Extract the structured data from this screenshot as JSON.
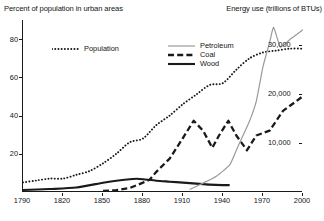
{
  "titles": {
    "left_axis": "Percent of population in urban areas",
    "right_axis": "Energy use (trillions of BTUs)"
  },
  "legend_left": [
    {
      "label": "Population",
      "style": "dotted",
      "color": "#1a1a1a"
    }
  ],
  "legend_right": [
    {
      "label": "Petroleum",
      "style": "thin-solid",
      "color": "#9a9a9a"
    },
    {
      "label": "Coal",
      "style": "bold-dashed",
      "color": "#1a1a1a"
    },
    {
      "label": "Wood",
      "style": "bold-solid",
      "color": "#1a1a1a"
    }
  ],
  "axes": {
    "x_ticks": [
      "1790",
      "1820",
      "1850",
      "1880",
      "1910",
      "1940",
      "1970",
      "2000"
    ],
    "y_left_ticks": [
      "20",
      "40",
      "60",
      "80"
    ],
    "y_right_ticks": [
      "10,000",
      "20,000",
      "30,000"
    ]
  },
  "chart_data": {
    "type": "line",
    "title": "",
    "xlabel": "",
    "ylabel": "Percent of population in urban areas",
    "y2label": "Energy use (trillions of BTUs)",
    "xlim": [
      1790,
      2000
    ],
    "ylim": [
      0,
      90
    ],
    "y2lim": [
      0,
      35000
    ],
    "grid": false,
    "legend_position": "inside-top",
    "x_ticks": [
      1790,
      1820,
      1850,
      1880,
      1910,
      1940,
      1970,
      2000
    ],
    "y_left_ticks": [
      20,
      40,
      60,
      80
    ],
    "y_right_ticks": [
      10000,
      20000,
      30000
    ],
    "series": [
      {
        "name": "Population",
        "axis": "left",
        "units": "percent",
        "style": "dotted",
        "color": "#1a1a1a",
        "x": [
          1790,
          1800,
          1810,
          1820,
          1830,
          1840,
          1850,
          1860,
          1870,
          1880,
          1890,
          1900,
          1910,
          1920,
          1930,
          1940,
          1950,
          1960,
          1970,
          1980,
          1990,
          2000
        ],
        "values": [
          5,
          6,
          7,
          7,
          9,
          11,
          15,
          20,
          26,
          28,
          35,
          40,
          46,
          51,
          56,
          57,
          64,
          70,
          73,
          74,
          75,
          75
        ]
      },
      {
        "name": "Wood",
        "axis": "right",
        "units": "trillions of BTUs",
        "style": "bold-solid",
        "color": "#1a1a1a",
        "x": [
          1790,
          1810,
          1830,
          1850,
          1860,
          1870,
          1875,
          1880,
          1890,
          1900,
          1910,
          1920,
          1930,
          1940,
          1945
        ],
        "values": [
          400,
          600,
          900,
          1900,
          2300,
          2600,
          2700,
          2600,
          2300,
          2100,
          1900,
          1700,
          1500,
          1400,
          1400
        ]
      },
      {
        "name": "Coal",
        "axis": "right",
        "units": "trillions of BTUs",
        "style": "bold-dashed",
        "color": "#1a1a1a",
        "x": [
          1850,
          1860,
          1870,
          1880,
          1885,
          1890,
          1900,
          1910,
          1918,
          1925,
          1932,
          1937,
          1944,
          1950,
          1958,
          1965,
          1975,
          1985,
          1995,
          2000
        ],
        "values": [
          200,
          400,
          800,
          1900,
          2500,
          4100,
          6800,
          11000,
          14500,
          12500,
          9000,
          11500,
          14500,
          11500,
          8500,
          11500,
          12500,
          16500,
          18500,
          19500
        ]
      },
      {
        "name": "Petroleum",
        "axis": "right",
        "units": "trillions of BTUs",
        "style": "thin-solid",
        "color": "#9a9a9a",
        "x": [
          1915,
          1925,
          1935,
          1945,
          1950,
          1955,
          1960,
          1965,
          1970,
          1975,
          1978,
          1983,
          1990,
          1995,
          2000
        ],
        "values": [
          500,
          1800,
          3200,
          5500,
          8500,
          11500,
          14500,
          18500,
          25500,
          30500,
          33500,
          29500,
          31000,
          32000,
          33000
        ]
      }
    ]
  }
}
